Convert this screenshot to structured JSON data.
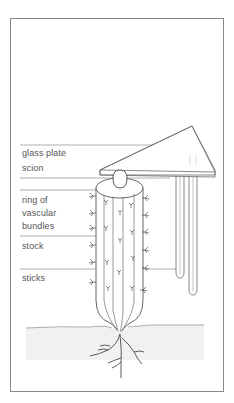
{
  "figure": {
    "colors": {
      "line": "#6a6a6a",
      "frame": "#8a8a8a",
      "text": "#555555",
      "soil": "#c8c8c8"
    }
  },
  "labels": [
    {
      "id": "glass-plate",
      "text": "glass plate"
    },
    {
      "id": "scion",
      "text": "scion"
    },
    {
      "id": "ring-of-vascular-bundles",
      "text": "ring of\nvascular\nbundles"
    },
    {
      "id": "stock",
      "text": "stock"
    },
    {
      "id": "sticks",
      "text": "sticks"
    }
  ]
}
